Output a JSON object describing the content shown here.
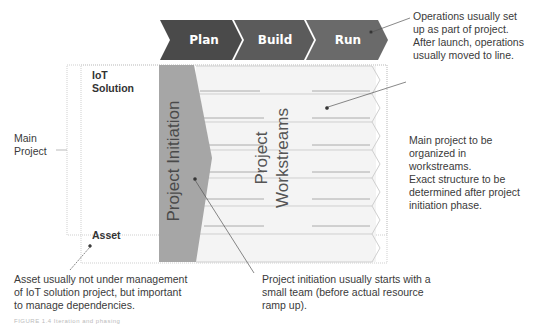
{
  "phases": [
    {
      "label": "Plan",
      "color": "#4a4a4a"
    },
    {
      "label": "Build",
      "color": "#5a5a5a"
    },
    {
      "label": "Run",
      "color": "#6a6a6a"
    }
  ],
  "left_bracket": {
    "label_line1": "Main",
    "label_line2": "Project"
  },
  "rows": {
    "iot_solution_line1": "IoT",
    "iot_solution_line2": "Solution",
    "asset": "Asset"
  },
  "blocks": {
    "initiation": "Project Initiation",
    "workstreams_line1": "Project",
    "workstreams_line2": "Workstreams",
    "workstream_row_count": 7
  },
  "notes": {
    "operations": [
      "Operations usually set",
      "up as part of project.",
      "After launch, operations",
      "usually moved to line."
    ],
    "main_project": [
      "Main project to be",
      "organized in",
      "workstreams.",
      "Exact structure to be",
      "determined after project",
      "initiation phase."
    ],
    "asset": [
      "Asset usually not under management",
      "of IoT solution project, but important",
      "to manage dependencies."
    ],
    "initiation": [
      "Project initiation usually starts with a",
      "small team (before actual resource",
      "ramp up)."
    ]
  },
  "figure_caption": "FIGURE 1.4 Iteration and phasing"
}
